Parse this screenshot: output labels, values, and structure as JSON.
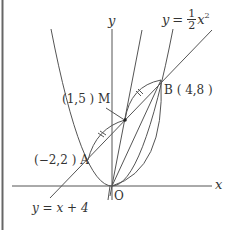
{
  "figure": {
    "type": "coordinate-geometry-diagram",
    "axes": {
      "x_label": "x",
      "y_label": "y",
      "origin_label": "O"
    },
    "curves": [
      {
        "name": "parabola",
        "equation_lhs": "y",
        "equation_eq": "=",
        "coef_num": "1",
        "coef_den": "2",
        "equation_var": "x",
        "equation_exp": "2"
      },
      {
        "name": "line",
        "equation": "y = x + 4"
      }
    ],
    "points": [
      {
        "name": "A",
        "coords": "(−2,2)",
        "label": "(−2,2 ) A"
      },
      {
        "name": "B",
        "coords": "(4,8)",
        "label": "B ( 4,8 )"
      },
      {
        "name": "M",
        "coords": "(1,5)",
        "label": "(1,5 ) M"
      },
      {
        "name": "O",
        "label": "O"
      }
    ],
    "colors": {
      "stroke": "#555555",
      "text": "#333333",
      "frame": "#666666"
    }
  }
}
